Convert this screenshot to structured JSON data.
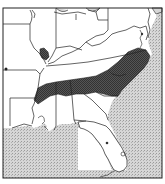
{
  "map": {
    "type": "range-map",
    "region": "Eastern United States",
    "colors": {
      "background": "#ffffff",
      "land": "#ffffff",
      "water": "#c8c8c8",
      "range_fill": "#4a4a4a",
      "border": "#222222"
    },
    "range_areas": [
      {
        "name": "primary-range",
        "states": [
          "Tennessee",
          "North Carolina",
          "northern Mississippi",
          "northern Alabama",
          "northern Georgia",
          "northwestern South Carolina",
          "southern Virginia"
        ]
      },
      {
        "name": "disjunct-range",
        "states": [
          "southern Illinois"
        ]
      }
    ],
    "water_bodies": [
      "Gulf of Mexico",
      "Atlantic Ocean"
    ]
  }
}
